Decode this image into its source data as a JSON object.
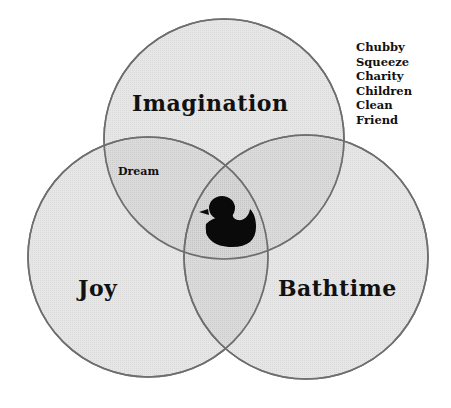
{
  "diagram": {
    "type": "venn",
    "circles": [
      {
        "id": "imagination",
        "label": "Imagination",
        "cx": 224,
        "cy": 139,
        "r": 120
      },
      {
        "id": "joy",
        "label": "Joy",
        "cx": 148,
        "cy": 257,
        "r": 120
      },
      {
        "id": "bathtime",
        "label": "Bathtime",
        "cx": 306,
        "cy": 257,
        "r": 122
      }
    ],
    "intersections": {
      "imagination_joy": "Dream",
      "center_icon": "rubber-duck-icon"
    },
    "word_list": [
      "Chubby",
      "Squeeze",
      "Charity",
      "Children",
      "Clean",
      "Friend"
    ],
    "colors": {
      "fill": "#c8c8c8",
      "stroke": "#6e6e6e",
      "text": "#111111",
      "duck": "#0a0a0a"
    }
  }
}
